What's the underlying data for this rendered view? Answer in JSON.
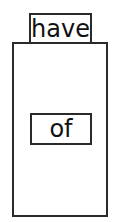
{
  "diagram": {
    "top_label": "have",
    "inner_label": "of",
    "colors": {
      "stroke": "#2a2a2a",
      "background": "#ffffff",
      "text": "#111111"
    }
  }
}
